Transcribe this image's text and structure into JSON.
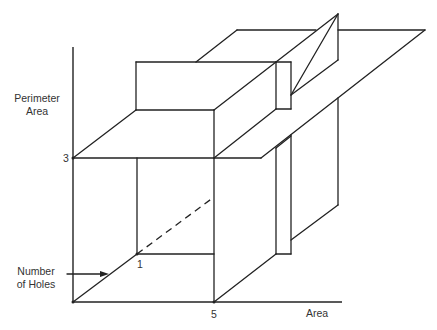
{
  "diagram": {
    "type": "3d-feature-space-partition",
    "axes": {
      "vertical": {
        "label_line1": "Perimeter",
        "label_line2": "Area",
        "tick": "3"
      },
      "depth": {
        "label_line1": "Number",
        "label_line2": "of Holes",
        "tick": "1"
      },
      "horizontal": {
        "label": "Area",
        "tick": "5"
      }
    },
    "colors": {
      "stroke": "#222222",
      "background": "#ffffff",
      "text": "#333333"
    }
  }
}
